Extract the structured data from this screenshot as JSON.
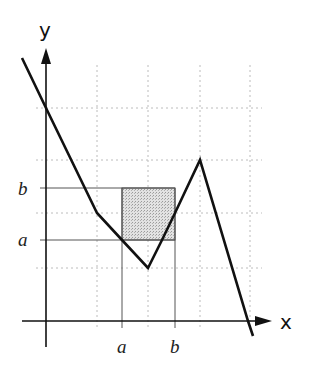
{
  "diagram": {
    "type": "function-graph",
    "axes": {
      "x_label": "x",
      "y_label": "y"
    },
    "x_ticks": [
      {
        "label": "a",
        "x": 122
      },
      {
        "label": "b",
        "x": 175
      }
    ],
    "y_ticks": [
      {
        "label": "b",
        "y": 188
      },
      {
        "label": "a",
        "y": 240
      }
    ],
    "grid": {
      "style": "dotted",
      "color": "#bbbbbb",
      "vertical_x": [
        97,
        148,
        200,
        250
      ],
      "horizontal_y": [
        108,
        160,
        213,
        268
      ]
    },
    "shaded_region": {
      "description": "square [a,b] x [a,b]",
      "x1": 122,
      "y1": 188,
      "x2": 175,
      "y2": 240,
      "fill": "#d9d9d9"
    },
    "curve": {
      "description": "piecewise linear function graph",
      "color": "#111111",
      "points": [
        [
          22,
          58
        ],
        [
          46,
          108
        ],
        [
          97,
          213
        ],
        [
          122,
          240
        ],
        [
          148,
          268
        ],
        [
          162,
          240
        ],
        [
          175,
          213
        ],
        [
          200,
          160
        ],
        [
          248,
          321
        ],
        [
          253,
          336
        ]
      ]
    },
    "colors": {
      "axis": "#111111",
      "guide_line": "#555555",
      "background": "#ffffff"
    }
  }
}
